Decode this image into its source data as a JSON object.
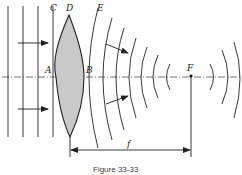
{
  "figure": {
    "labels": {
      "C": "C",
      "D": "D",
      "E": "E",
      "A": "A",
      "B": "B",
      "F": "F",
      "f": "f"
    },
    "caption": "Figure 33-33",
    "colors": {
      "lens_fill": "#c9c9c9",
      "stroke": "#222222",
      "background": "#ffffff"
    },
    "elements": {
      "incident_plane_wavefronts": 4,
      "converging_wavefronts": 8,
      "diverging_wavefronts_after_focus": 2,
      "arrows": [
        "incident-upper",
        "incident-lower",
        "converging-upper",
        "converging-lower"
      ]
    }
  }
}
